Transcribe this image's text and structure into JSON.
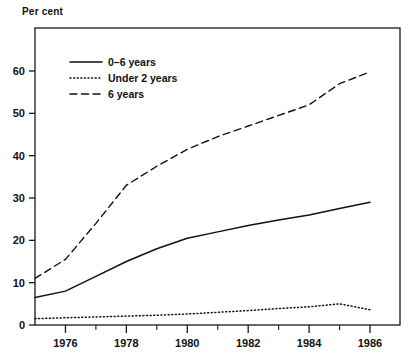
{
  "chart_data": {
    "type": "line",
    "title": "",
    "ylabel": "Per cent",
    "xlabel": "",
    "ylim": [
      0,
      65
    ],
    "xlim": [
      1975,
      1986.8
    ],
    "grid": false,
    "legend_position": "top-left",
    "yticks": [
      0,
      10,
      20,
      30,
      40,
      50,
      60
    ],
    "ytick_labels": [
      "0",
      "10",
      "20",
      "30",
      "40",
      "50",
      "60"
    ],
    "xticks": [
      1976,
      1978,
      1980,
      1982,
      1984,
      1986
    ],
    "xtick_labels": [
      "1976",
      "1978",
      "1980",
      "1982",
      "1984",
      "1986"
    ],
    "xticks_minor": [
      1975,
      1977,
      1979,
      1981,
      1983,
      1985
    ],
    "x": [
      1975,
      1976,
      1977,
      1978,
      1979,
      1980,
      1981,
      1982,
      1983,
      1984,
      1985,
      1986
    ],
    "series": [
      {
        "name": "0–6 years",
        "style": "solid",
        "values": [
          6.5,
          8.0,
          11.5,
          15.0,
          18.0,
          20.5,
          22.0,
          23.5,
          24.8,
          26.0,
          27.5,
          29.0
        ]
      },
      {
        "name": "Under 2 years",
        "style": "dotted",
        "values": [
          1.5,
          1.7,
          1.9,
          2.1,
          2.3,
          2.6,
          3.0,
          3.4,
          3.9,
          4.3,
          5.0,
          3.6
        ]
      },
      {
        "name": "6 years",
        "style": "dashed",
        "values": [
          11.0,
          15.5,
          24.0,
          33.0,
          37.5,
          41.5,
          44.5,
          47.0,
          49.5,
          52.0,
          57.0,
          59.8
        ]
      }
    ]
  },
  "legend": {
    "items": [
      {
        "label": "0–6 years",
        "style": "solid"
      },
      {
        "label": "Under 2 years",
        "style": "dotted"
      },
      {
        "label": "6 years",
        "style": "dashed"
      }
    ]
  },
  "axis": {
    "y_title": "Per cent"
  }
}
